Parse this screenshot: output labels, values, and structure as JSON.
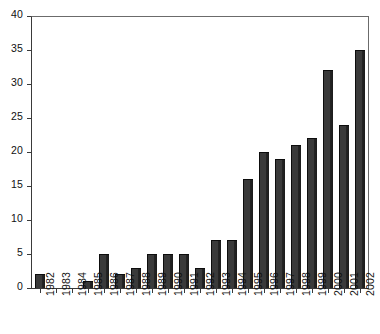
{
  "chart_data": {
    "type": "bar",
    "title": "",
    "subtitle": "",
    "xlabel": "",
    "ylabel": "",
    "categories": [
      "1982",
      "1983",
      "1984",
      "1985",
      "1986",
      "1987",
      "1988",
      "1989",
      "1990",
      "1991",
      "1992",
      "1993",
      "1994",
      "1995",
      "1996",
      "1997",
      "1998",
      "1999",
      "2000",
      "2001",
      "2002"
    ],
    "values": [
      2,
      0,
      0,
      1,
      5,
      2,
      3,
      5,
      5,
      5,
      3,
      7,
      7,
      16,
      20,
      19,
      21,
      22,
      32,
      24,
      35
    ],
    "ylim": [
      0,
      40
    ],
    "ytick_values": [
      0,
      5,
      10,
      15,
      20,
      25,
      30,
      35,
      40
    ],
    "ytick_labels": [
      "0",
      "5",
      "10",
      "15",
      "20",
      "25",
      "30",
      "35",
      "40"
    ],
    "grid": false,
    "legend": null,
    "legend_position": "none",
    "bar_color": "#333333",
    "axis_color": "#3a3a3a",
    "frame_color": "#6b6b6b",
    "background_color": "#ffffff",
    "xtick_label_rotation": -90
  }
}
